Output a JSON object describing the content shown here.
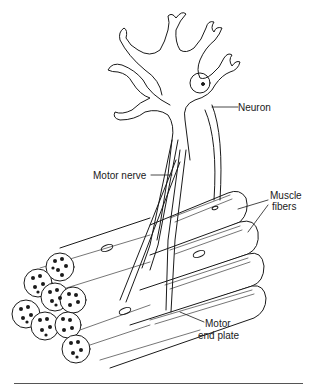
{
  "diagram": {
    "type": "anatomical-illustration",
    "labels": {
      "neuron": "Neuron",
      "motor_nerve": "Motor nerve",
      "muscle_fibers_line1": "Muscle",
      "muscle_fibers_line2": "fibers",
      "end_plate_line1": "Motor",
      "end_plate_line2": "end plate"
    },
    "colors": {
      "ink": "#1a1a1a",
      "background": "#ffffff",
      "rule": "#555555"
    }
  }
}
